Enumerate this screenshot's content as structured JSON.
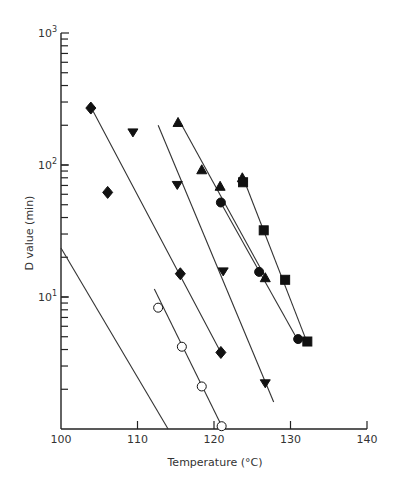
{
  "chart_data": {
    "type": "scatter",
    "title": "",
    "xlabel": "Temperature (°C)",
    "ylabel": "D value (min)",
    "xlim": [
      100,
      140
    ],
    "ylim": [
      1,
      1000
    ],
    "yscale": "log",
    "grid": false,
    "legend": "none",
    "x_ticks": [
      "100",
      "110",
      "120",
      "130",
      "140"
    ],
    "y_ticks": [
      {
        "base": "10",
        "exp": "1"
      },
      {
        "base": "10",
        "exp": "2"
      },
      {
        "base": "10",
        "exp": "3"
      }
    ],
    "series": [
      {
        "name": "filled diamonds",
        "marker": "diamond",
        "fill": "filled",
        "points": [
          [
            103.9,
            270
          ],
          [
            106.1,
            62
          ],
          [
            115.6,
            15
          ],
          [
            120.9,
            3.8
          ]
        ],
        "line": [
          [
            104.2,
            255
          ],
          [
            121.0,
            3.7
          ]
        ]
      },
      {
        "name": "filled inverted triangles",
        "marker": "triangle-down",
        "fill": "filled",
        "points": [
          [
            109.4,
            175
          ],
          [
            115.2,
            70
          ],
          [
            121.2,
            15.5
          ],
          [
            126.7,
            2.2
          ]
        ],
        "line": [
          [
            112.7,
            200
          ],
          [
            127.8,
            1.6
          ]
        ]
      },
      {
        "name": "filled triangles",
        "marker": "triangle-up",
        "fill": "filled",
        "points": [
          [
            115.3,
            210
          ],
          [
            118.4,
            92
          ],
          [
            120.8,
            69
          ],
          [
            126.7,
            14
          ],
          [
            123.7,
            80
          ]
        ],
        "line": [
          [
            115.8,
            200
          ],
          [
            126.9,
            13.5
          ]
        ]
      },
      {
        "name": "filled circles",
        "marker": "circle",
        "fill": "filled",
        "points": [
          [
            120.9,
            52
          ],
          [
            125.9,
            15.5
          ],
          [
            131.0,
            4.8
          ]
        ],
        "line": [
          [
            121.2,
            48
          ],
          [
            130.7,
            5.0
          ]
        ]
      },
      {
        "name": "filled squares",
        "marker": "square",
        "fill": "filled",
        "points": [
          [
            123.8,
            74
          ],
          [
            126.5,
            32
          ],
          [
            129.3,
            13.5
          ],
          [
            132.2,
            4.6
          ]
        ],
        "line": [
          [
            124.2,
            70
          ],
          [
            132.0,
            4.8
          ]
        ]
      },
      {
        "name": "open circles",
        "marker": "circle",
        "fill": "open",
        "points": [
          [
            112.7,
            8.3
          ],
          [
            115.8,
            4.2
          ],
          [
            118.4,
            2.1
          ],
          [
            121.0,
            1.05
          ]
        ],
        "line": [
          [
            112.2,
            11.5
          ],
          [
            121.2,
            1.0
          ]
        ]
      },
      {
        "name": "line only",
        "marker": "none",
        "fill": "none",
        "points": [],
        "line": [
          [
            100.0,
            23.5
          ],
          [
            114.0,
            1.0
          ]
        ]
      }
    ]
  }
}
